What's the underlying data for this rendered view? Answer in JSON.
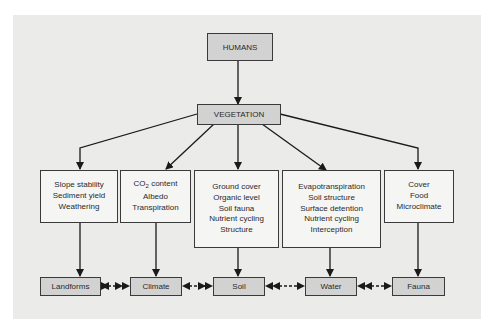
{
  "diagram": {
    "top": "HUMANS",
    "center": "VEGETATION",
    "effects": [
      {
        "lines": [
          "Slope stability",
          "Sediment yield",
          "Weathering"
        ]
      },
      {
        "lines": [
          "CO",
          "Albedo",
          "Transpiration"
        ],
        "first_line_sub": "2",
        "first_line_rest": " content"
      },
      {
        "lines": [
          "Ground cover",
          "Organic level",
          "Soil fauna",
          "Nutrient cycling",
          "Structure"
        ]
      },
      {
        "lines": [
          "Evapotranspiration",
          "Soil structure",
          "Surface detention",
          "Nutrient cycling",
          "Interception"
        ]
      },
      {
        "lines": [
          "Cover",
          "Food",
          "Microclimate"
        ]
      }
    ],
    "outcomes": [
      "Landforms",
      "Climate",
      "Soil",
      "Water",
      "Fauna"
    ]
  },
  "colors": {
    "panel": "#ebebea",
    "shaded_box": "#d2d2d2",
    "white_box": "#f5f5f4",
    "stroke": "#1a1a1a"
  }
}
